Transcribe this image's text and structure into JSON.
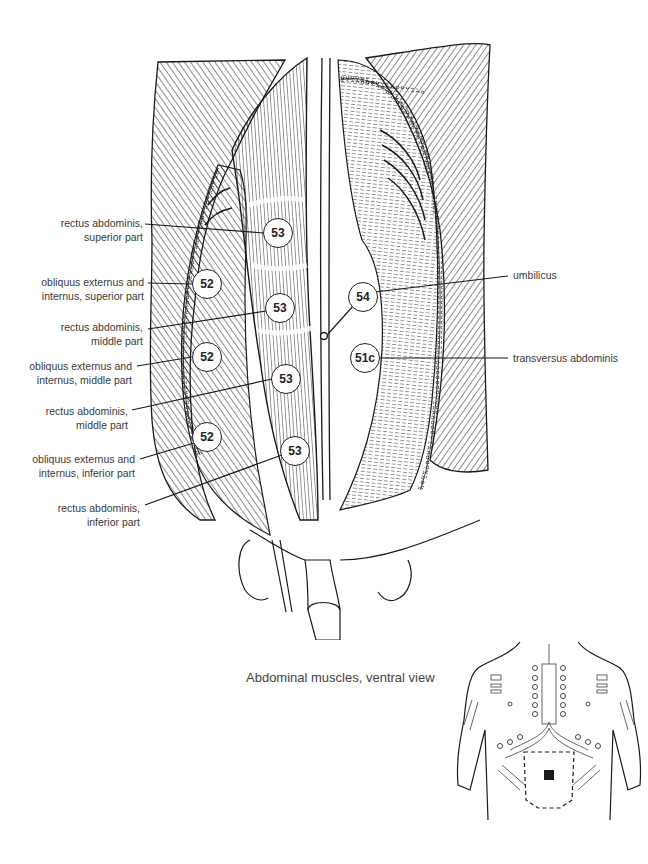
{
  "figure": {
    "caption": "Abdominal muscles, ventral view",
    "ink_color": "#1a1a1a",
    "background": "#ffffff"
  },
  "labels_left": [
    {
      "id": "rectus-superior",
      "line1": "rectus abdominis,",
      "line2": "superior part",
      "point": "53"
    },
    {
      "id": "obliquus-superior",
      "line1": "obliquus externus and",
      "line2": "internus, superior part",
      "point": "52"
    },
    {
      "id": "rectus-middle-1",
      "line1": "rectus abdominis,",
      "line2": "middle part",
      "point": "53"
    },
    {
      "id": "obliquus-middle",
      "line1": "obliquus externus and",
      "line2": "internus, middle part",
      "point": "52"
    },
    {
      "id": "rectus-middle-2",
      "line1": "rectus abdominis,",
      "line2": "middle part",
      "point": "53"
    },
    {
      "id": "obliquus-inferior",
      "line1": "obliquus externus and",
      "line2": "internus, inferior part",
      "point": "52"
    },
    {
      "id": "rectus-inferior",
      "line1": "rectus abdominis,",
      "line2": "inferior part",
      "point": "53"
    }
  ],
  "labels_right": [
    {
      "id": "umbilicus",
      "text": "umbilicus",
      "point": "54"
    },
    {
      "id": "transversus",
      "text": "transversus abdominis",
      "point": "51c"
    }
  ],
  "points": [
    {
      "label": "53",
      "x": 278,
      "y": 233
    },
    {
      "label": "52",
      "x": 207,
      "y": 284
    },
    {
      "label": "53",
      "x": 280,
      "y": 308
    },
    {
      "label": "54",
      "x": 363,
      "y": 297
    },
    {
      "label": "52",
      "x": 207,
      "y": 357
    },
    {
      "label": "53",
      "x": 286,
      "y": 379
    },
    {
      "label": "51c",
      "x": 365,
      "y": 358
    },
    {
      "label": "52",
      "x": 207,
      "y": 437
    },
    {
      "label": "53",
      "x": 295,
      "y": 451
    }
  ]
}
